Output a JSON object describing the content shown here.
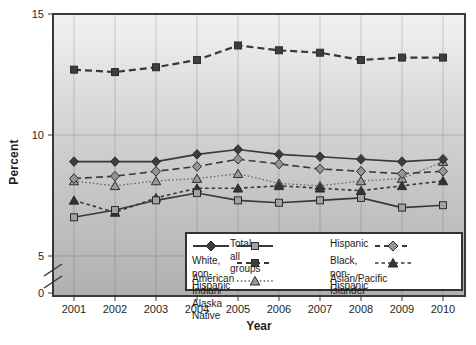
{
  "axes": {
    "ylabel": "Percent",
    "xlabel": "Year"
  },
  "chart_data": {
    "type": "line",
    "title": "",
    "xlabel": "Year",
    "ylabel": "Percent",
    "x": [
      2001,
      2002,
      2003,
      2004,
      2005,
      2006,
      2007,
      2008,
      2009,
      2010
    ],
    "ylim": [
      0,
      15
    ],
    "yticks": [
      15,
      10,
      5,
      0
    ],
    "axis_break_between": [
      0,
      5
    ],
    "grid": true,
    "legend_position": "inside-bottom-right",
    "series": [
      {
        "name": "Black, non-Hispanic",
        "values": [
          12.7,
          12.6,
          12.8,
          13.1,
          13.7,
          13.5,
          13.4,
          13.1,
          13.2,
          13.2
        ],
        "line": "dashed",
        "dash": "7,4",
        "width": 2.2,
        "stroke": "#383838",
        "marker": "square",
        "marker_fill": "#3d3d3d"
      },
      {
        "name": "Asian/Pacific Islander",
        "values": [
          8.1,
          7.9,
          8.1,
          8.2,
          8.4,
          8.0,
          7.9,
          8.1,
          8.2,
          8.9
        ],
        "line": "dotted",
        "dash": "1.6,2.2",
        "width": 1.3,
        "stroke": "#6b6a68",
        "marker": "triangle",
        "marker_fill": "#9a9997"
      },
      {
        "name": "American Indian/Alaska Native",
        "values": [
          7.3,
          6.8,
          7.4,
          7.8,
          7.8,
          7.9,
          7.8,
          7.7,
          7.9,
          8.1
        ],
        "line": "dashed-short",
        "dash": "3.5,3",
        "width": 1.6,
        "stroke": "#383838",
        "marker": "triangle",
        "marker_fill": "#333333"
      },
      {
        "name": "Hispanic",
        "values": [
          6.6,
          6.9,
          7.3,
          7.6,
          7.3,
          7.2,
          7.3,
          7.4,
          7.0,
          7.1
        ],
        "line": "solid",
        "dash": "",
        "width": 1.6,
        "stroke": "#383838",
        "marker": "square",
        "marker_fill": "#a3a2a0"
      },
      {
        "name": "White, non-Hispanic",
        "values": [
          8.2,
          8.3,
          8.5,
          8.7,
          9.0,
          8.8,
          8.6,
          8.5,
          8.4,
          8.5
        ],
        "line": "dashed",
        "dash": "7,4",
        "width": 1.6,
        "stroke": "#383838",
        "marker": "diamond",
        "marker_fill": "#959492"
      },
      {
        "name": "Total, all groups",
        "values": [
          8.9,
          8.9,
          8.9,
          9.2,
          9.4,
          9.2,
          9.1,
          9.0,
          8.9,
          9.0
        ],
        "line": "solid",
        "dash": "",
        "width": 1.6,
        "stroke": "#383838",
        "marker": "diamond",
        "marker_fill": "#3d3d3d"
      }
    ]
  },
  "legend": {
    "items": [
      {
        "label": "Total, all groups"
      },
      {
        "label": "Hispanic"
      },
      {
        "label": "White, non-Hispanic"
      },
      {
        "label": "Black, non-Hispanic"
      },
      {
        "label": "American Indian/\nAlaska Native"
      },
      {
        "label": "Asian/Pacific Islander"
      }
    ]
  },
  "colors": {
    "frame": "#383838",
    "text": "#1f1f1f",
    "plot_gradient_top": "#f3f2f0",
    "plot_gradient_mid": "#d3d2d0",
    "plot_gradient_bottom": "#b1b0ae",
    "gridline": "rgba(70,70,70,0.22)"
  }
}
